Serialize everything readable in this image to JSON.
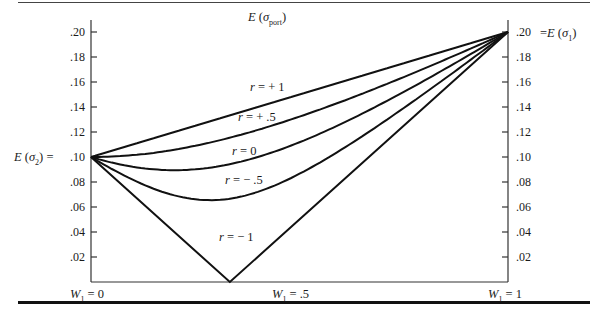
{
  "figure": {
    "y_title": "E (σport)",
    "left_axis_label": "E (σ2) = .10",
    "right_axis_label": "= E (σ1)",
    "x_labels": [
      "W1 = 0",
      "W1 = .5",
      "W1 = 1"
    ],
    "left_ticks": [
      ".20",
      ".18",
      ".16",
      ".14",
      ".12",
      ".10",
      ".08",
      ".06",
      ".04",
      ".02"
    ],
    "right_ticks": [
      ".20",
      ".18",
      ".16",
      ".14",
      ".12",
      ".10",
      ".08",
      ".06",
      ".04",
      ".02"
    ],
    "curve_labels": [
      "r = + 1",
      "r = + .5",
      "r = 0",
      "r = − .5",
      "r = − 1"
    ]
  },
  "chart_data": {
    "type": "line",
    "title": "",
    "xlabel": "W1",
    "ylabel": "E (σport)",
    "xlim": [
      0,
      1
    ],
    "ylim": [
      0,
      0.2
    ],
    "grid": false,
    "legend": "inline curve labels",
    "note": "Values computed from sigma_p = sqrt(W^2*s1^2 + (1-W)^2*s2^2 + 2*W*(1-W)*r*s1*s2), s1=.20, s2=.10 — derived from the model that fits the plotted curves, not read point-by-point from pixels.",
    "x_tick_labels": [
      "W1 = 0",
      "W1 = .5",
      "W1 = 1"
    ],
    "y_tick_labels": [
      ".02",
      ".04",
      ".06",
      ".08",
      ".10",
      ".12",
      ".14",
      ".16",
      ".18",
      ".20"
    ],
    "annotations": [
      "E (σ2) = .10",
      ".20 = E (σ1)",
      "E (σport)"
    ],
    "x": [
      0,
      0.1,
      0.2,
      0.3,
      0.4,
      0.5,
      0.6,
      0.7,
      0.8,
      0.9,
      1.0
    ],
    "series": [
      {
        "name": "r = +1",
        "values": [
          0.1,
          0.11,
          0.12,
          0.13,
          0.14,
          0.15,
          0.16,
          0.17,
          0.18,
          0.19,
          0.2
        ]
      },
      {
        "name": "r = +.5",
        "values": [
          0.1,
          0.097,
          0.098,
          0.103,
          0.111,
          0.122,
          0.136,
          0.15,
          0.166,
          0.183,
          0.2
        ]
      },
      {
        "name": "r = 0",
        "values": [
          0.1,
          0.092,
          0.089,
          0.092,
          0.1,
          0.112,
          0.126,
          0.143,
          0.161,
          0.18,
          0.2
        ]
      },
      {
        "name": "r = -.5",
        "values": [
          0.1,
          0.082,
          0.069,
          0.066,
          0.072,
          0.087,
          0.106,
          0.128,
          0.151,
          0.175,
          0.2
        ]
      },
      {
        "name": "r = -1",
        "values": [
          0.1,
          0.07,
          0.04,
          0.01,
          0.02,
          0.05,
          0.08,
          0.11,
          0.14,
          0.17,
          0.2
        ],
        "vertex": {
          "x": 0.333,
          "y": 0.0
        }
      }
    ]
  }
}
